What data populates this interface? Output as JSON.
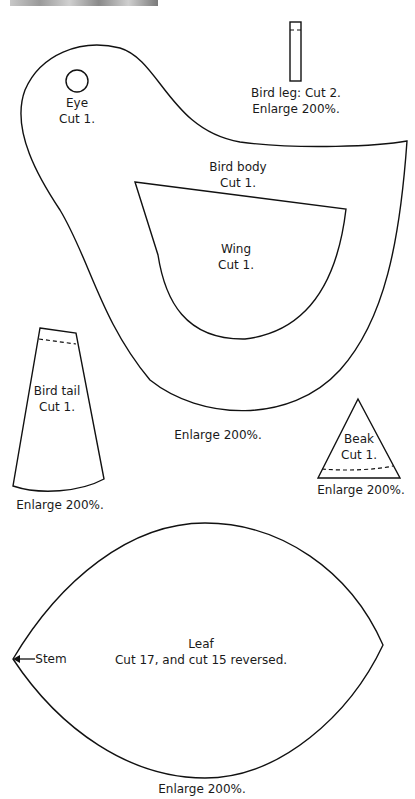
{
  "pieces": {
    "eye": {
      "name": "Eye",
      "cut": "Cut 1."
    },
    "bird_leg": {
      "line1": "Bird leg: Cut 2.",
      "line2": "Enlarge 200%."
    },
    "bird_body": {
      "name": "Bird body",
      "cut": "Cut 1.",
      "enlarge": "Enlarge 200%."
    },
    "wing": {
      "name": "Wing",
      "cut": "Cut 1."
    },
    "bird_tail": {
      "name": "Bird tail",
      "cut": "Cut 1.",
      "enlarge": "Enlarge 200%."
    },
    "beak": {
      "name": "Beak",
      "cut": "Cut 1.",
      "enlarge": "Enlarge 200%."
    },
    "leaf": {
      "name": "Leaf",
      "cut": "Cut 17, and cut 15 reversed.",
      "stem": "Stem",
      "enlarge": "Enlarge 200%."
    }
  }
}
